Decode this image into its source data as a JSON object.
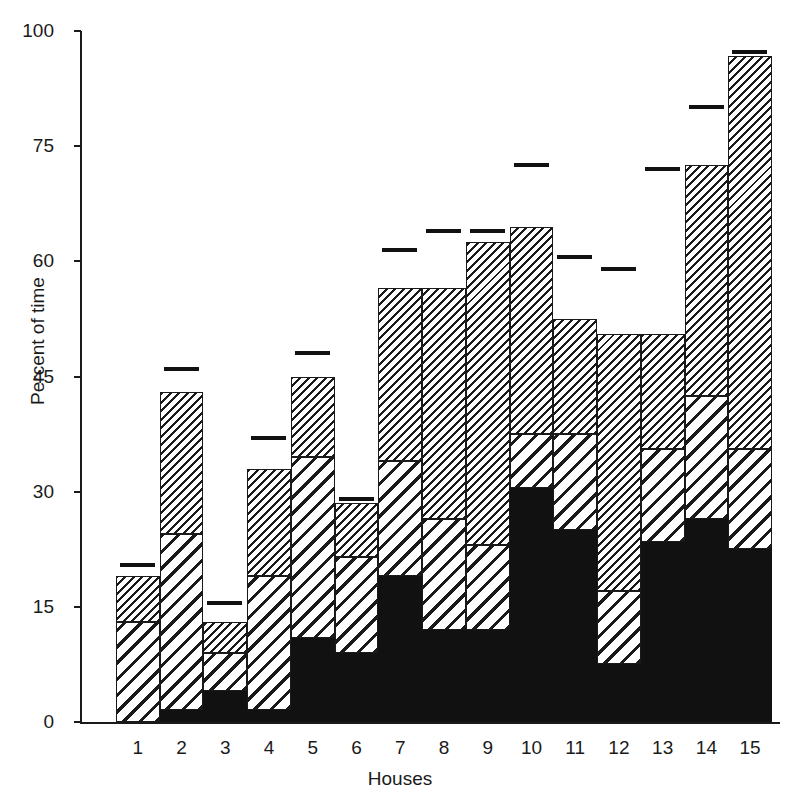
{
  "chart_data": {
    "type": "bar",
    "title": "",
    "subtitle": "",
    "xlabel": "Houses",
    "ylabel": "Percent of time",
    "categories": [
      "1",
      "2",
      "3",
      "4",
      "5",
      "6",
      "7",
      "8",
      "9",
      "10",
      "11",
      "12",
      "13",
      "14",
      "15"
    ],
    "ytick_values": [
      0,
      15,
      30,
      45,
      60,
      75,
      100
    ],
    "ytick_labels": [
      "0",
      "15",
      "30",
      "45",
      "60",
      "75",
      "100"
    ],
    "ylim": [
      0,
      100
    ],
    "axis_note": "non-linear y-axis: ticks 0,15,30,45,60,75 are evenly spaced, 75-100 occupies one equal interval",
    "grid": false,
    "legend": "none",
    "stacked": true,
    "series": [
      {
        "name": "bottom-solid-black",
        "pattern": "solid-black",
        "values": [
          0,
          1.5,
          4,
          1.5,
          11,
          9,
          19,
          12,
          12,
          30.5,
          25,
          7.5,
          23.5,
          26.5,
          22.5
        ]
      },
      {
        "name": "middle-coarse-hatch",
        "pattern": "coarse-diagonal-hatch",
        "values": [
          13,
          23,
          5,
          17.5,
          23.5,
          12.5,
          15,
          14.5,
          11,
          7,
          12.5,
          9.5,
          12,
          16,
          13
        ]
      },
      {
        "name": "top-fine-hatch",
        "pattern": "fine-diagonal-hatch",
        "values": [
          6,
          18.5,
          4,
          14,
          10.5,
          7,
          22.5,
          30,
          39.5,
          27,
          15,
          33.5,
          15,
          30,
          59
        ]
      }
    ],
    "totals": [
      19,
      43,
      13,
      33,
      45,
      28.5,
      56.5,
      56.5,
      62.5,
      64.5,
      52.5,
      50.5,
      50.5,
      72.5,
      94.5
    ],
    "markers": {
      "name": "reference-line-marker",
      "values": [
        20.5,
        46,
        15.5,
        37,
        48,
        29,
        61.5,
        64,
        64,
        72.5,
        60.5,
        59,
        72,
        83.5,
        95.5
      ]
    }
  },
  "axis": {
    "y_title": "Percent of time",
    "x_title": "Houses"
  }
}
